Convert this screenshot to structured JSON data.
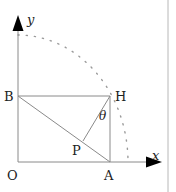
{
  "diagram": {
    "axes": {
      "x_label": "x",
      "y_label": "y"
    },
    "points": {
      "O": "O",
      "A": "A",
      "B": "B",
      "H": "H",
      "P": "P"
    },
    "angle_label": "θ",
    "colors": {
      "line": "#8a8a8a",
      "axis_arrow": "#000000",
      "text": "#222222",
      "border": "#b0b0b0"
    }
  }
}
